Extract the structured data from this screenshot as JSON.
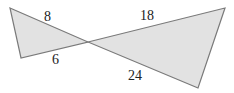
{
  "diagram": {
    "type": "bowtie-similar-triangles",
    "colors": {
      "fill": "#e2e2e2",
      "stroke": "#7a7a7a",
      "text": "#222222"
    },
    "points": {
      "A": [
        10,
        8
      ],
      "B": [
        21,
        58
      ],
      "O": [
        88,
        42
      ],
      "C": [
        225,
        8
      ],
      "D": [
        198,
        88
      ]
    },
    "labels": [
      {
        "id": "side-8",
        "text": "8",
        "x": 44,
        "y": 21
      },
      {
        "id": "side-6",
        "text": "6",
        "x": 52,
        "y": 64
      },
      {
        "id": "side-18",
        "text": "18",
        "x": 140,
        "y": 20
      },
      {
        "id": "side-24",
        "text": "24",
        "x": 128,
        "y": 80
      }
    ]
  }
}
